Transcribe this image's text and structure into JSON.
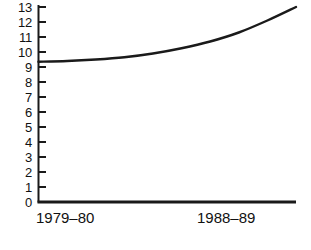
{
  "chart_data": {
    "type": "line",
    "title": "",
    "xlabel": "",
    "ylabel": "",
    "ylim": [
      0,
      13
    ],
    "xlim": [
      0,
      9
    ],
    "grid": false,
    "legend": false,
    "y_ticks": [
      0,
      1,
      2,
      3,
      4,
      5,
      6,
      7,
      8,
      9,
      10,
      11,
      12,
      13
    ],
    "y_tick_labels": [
      "0",
      "1",
      "2",
      "3",
      "4",
      "5",
      "6",
      "7",
      "8",
      "9",
      "10",
      "11",
      "12",
      "13"
    ],
    "x_tick_labels": [
      "1979–80",
      "1988–89"
    ],
    "series": [
      {
        "name": "series-1",
        "color": "#1a1a1a",
        "x": [
          0,
          1,
          2,
          3,
          4,
          5,
          6,
          7,
          8,
          9
        ],
        "values": [
          9.35,
          9.4,
          9.5,
          9.65,
          9.9,
          10.25,
          10.7,
          11.3,
          12.1,
          13.0
        ]
      }
    ]
  },
  "axes": {
    "y_axis_name": "y-axis",
    "x_axis_name": "x-axis"
  }
}
